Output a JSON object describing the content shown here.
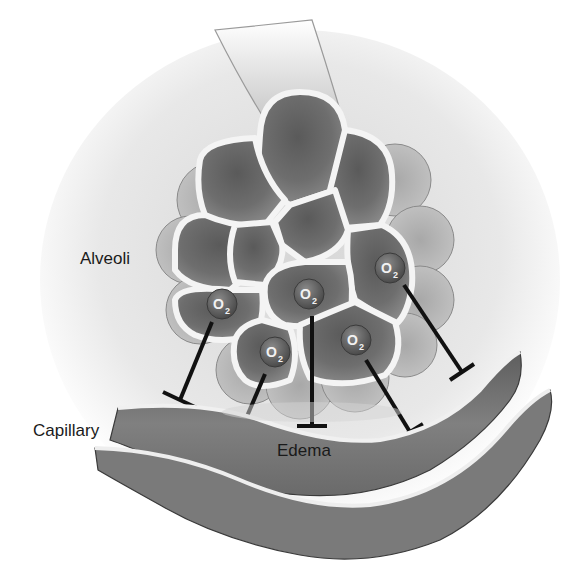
{
  "diagram": {
    "labels": {
      "alveoli": "Alveoli",
      "capillary": "Capillary",
      "edema": "Edema"
    },
    "molecules": [
      {
        "symbol": "O",
        "subscript": "2"
      },
      {
        "symbol": "O",
        "subscript": "2"
      },
      {
        "symbol": "O",
        "subscript": "2"
      },
      {
        "symbol": "O",
        "subscript": "2"
      },
      {
        "symbol": "O",
        "subscript": "2"
      },
      {
        "symbol": "O",
        "subscript": "2"
      }
    ],
    "colors": {
      "background": "#ffffff",
      "alveolus_fill": "#6e6e6e",
      "alveolus_wall": "#f4f4f4",
      "capillary_fill": "#777777",
      "blocker_line": "#111111",
      "text": "#1a1a1a"
    }
  }
}
